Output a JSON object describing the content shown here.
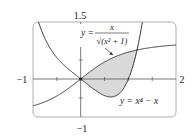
{
  "chart_data": {
    "type": "line",
    "title": "",
    "xlabel": "",
    "ylabel": "",
    "xlim": [
      -1,
      2
    ],
    "ylim": [
      -1,
      1.5
    ],
    "tick_labels": {
      "x_min": "−1",
      "x_max": "2",
      "y_max": "1.5",
      "y_min": "−1"
    },
    "grid": false,
    "series": [
      {
        "name": "y = x/√(x²+1)",
        "expression": "x/sqrt(x^2+1)"
      },
      {
        "name": "y = x⁴ − x",
        "expression": "x^4 - x"
      }
    ],
    "shaded_region": {
      "between": [
        "x/sqrt(x^2+1)",
        "x^4 - x"
      ],
      "x_from": 0,
      "x_to": 1.18,
      "color": "#d9d9d9"
    },
    "annotations": [
      {
        "text_prefix": "y =",
        "numerator": "x",
        "denominator": "√(x² + 1)",
        "arrow_to": "curve 1"
      },
      {
        "text": "y = x⁴ − x"
      }
    ]
  }
}
